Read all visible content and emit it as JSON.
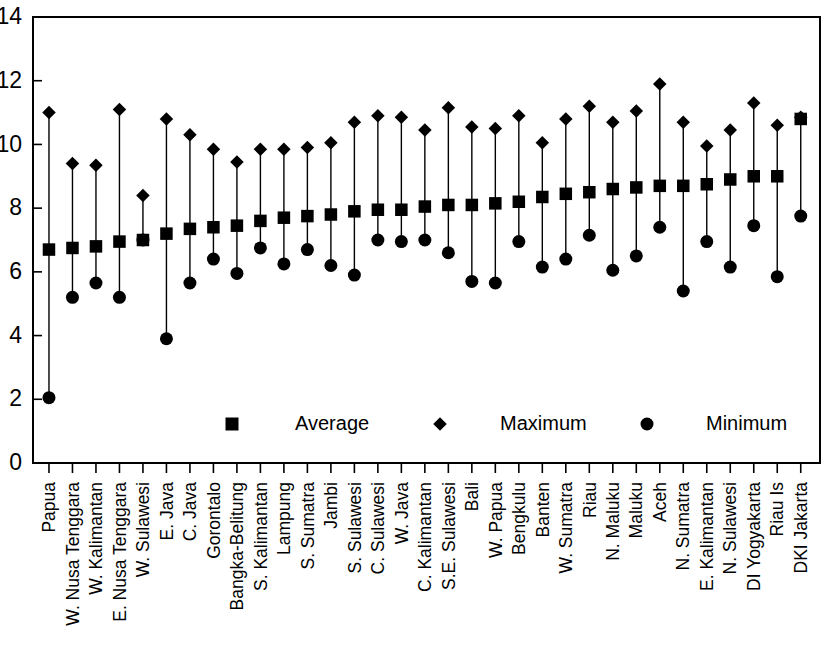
{
  "chart_data": {
    "type": "scatter",
    "title": "",
    "subtitle": "",
    "xlabel": "",
    "ylabel": "",
    "ylim": [
      0,
      14
    ],
    "yticks": [
      0,
      2,
      4,
      6,
      8,
      10,
      12,
      14
    ],
    "ytick_labels": [
      "0",
      "2",
      "4",
      "6",
      "8",
      "10",
      "12",
      "14"
    ],
    "grid": false,
    "legend_position": "inside-bottom-center",
    "legend": [
      {
        "label": "Average",
        "marker": "square"
      },
      {
        "label": "Maximum",
        "marker": "diamond"
      },
      {
        "label": "Minimum",
        "marker": "circle"
      }
    ],
    "categories": [
      "Papua",
      "W. Nusa Tenggara",
      "W. Kalimantan",
      "E. Nusa Tenggara",
      "W. Sulawesi",
      "E. Java",
      "C. Java",
      "Gorontalo",
      "Bangka-Belitung",
      "S. Kalimantan",
      "Lampung",
      "S. Sumatra",
      "Jambi",
      "S. Sulawesi",
      "C. Sulawesi",
      "W. Java",
      "C. Kalimantan",
      "S.E. Sulawesi",
      "Bali",
      "W. Papua",
      "Bengkulu",
      "Banten",
      "W. Sumatra",
      "Riau",
      "N. Maluku",
      "Maluku",
      "Aceh",
      "N. Sumatra",
      "E. Kalimantan",
      "N. Sulawesi",
      "DI Yogyakarta",
      "Riau Is",
      "DKI Jakarta"
    ],
    "series": [
      {
        "name": "Average",
        "marker": "square",
        "values": [
          6.7,
          6.75,
          6.8,
          6.95,
          7.0,
          7.2,
          7.35,
          7.4,
          7.45,
          7.6,
          7.7,
          7.75,
          7.8,
          7.9,
          7.95,
          7.95,
          8.05,
          8.1,
          8.1,
          8.15,
          8.2,
          8.35,
          8.45,
          8.5,
          8.6,
          8.65,
          8.7,
          8.7,
          8.75,
          8.9,
          9.0,
          9.0,
          10.8
        ]
      },
      {
        "name": "Maximum",
        "marker": "diamond",
        "values": [
          11.0,
          9.4,
          9.35,
          11.1,
          8.4,
          10.8,
          10.3,
          9.85,
          9.45,
          9.85,
          9.85,
          9.9,
          10.05,
          10.7,
          10.9,
          10.85,
          10.45,
          11.15,
          10.55,
          10.5,
          10.9,
          10.05,
          10.8,
          11.2,
          10.7,
          11.05,
          11.9,
          10.7,
          9.95,
          10.45,
          11.3,
          10.6,
          10.85
        ]
      },
      {
        "name": "Minimum",
        "marker": "circle",
        "values": [
          2.05,
          5.2,
          5.65,
          5.2,
          7.0,
          3.9,
          5.65,
          6.4,
          5.95,
          6.75,
          6.25,
          6.7,
          6.2,
          5.9,
          7.0,
          6.95,
          7.0,
          6.6,
          5.7,
          5.65,
          6.95,
          6.15,
          6.4,
          7.15,
          6.05,
          6.5,
          7.4,
          5.4,
          6.95,
          6.15,
          7.45,
          5.85,
          7.75
        ]
      }
    ]
  }
}
